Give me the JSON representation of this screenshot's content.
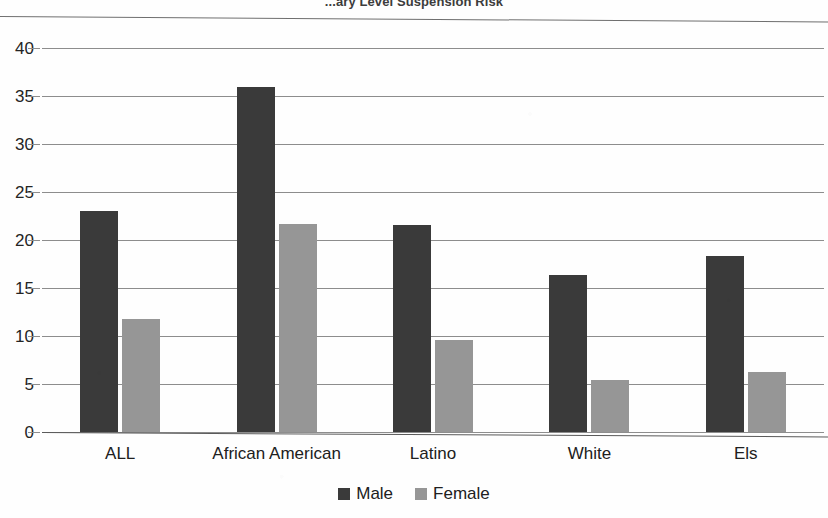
{
  "chart_data": {
    "type": "bar",
    "title": "...ary Level Suspension Risk",
    "xlabel": "",
    "ylabel": "",
    "ylim": [
      0,
      40
    ],
    "yticks": [
      0,
      5,
      10,
      15,
      20,
      25,
      30,
      35,
      40
    ],
    "grid": true,
    "legend_position": "bottom",
    "categories": [
      "ALL",
      "African American",
      "Latino",
      "White",
      "Els"
    ],
    "series": [
      {
        "name": "Male",
        "color": "#3a3a3a",
        "values": [
          23.0,
          35.9,
          21.6,
          16.4,
          18.3
        ]
      },
      {
        "name": "Female",
        "color": "#969696",
        "values": [
          11.8,
          21.7,
          9.6,
          5.4,
          6.2
        ]
      }
    ]
  },
  "axis": {
    "tick_labels": [
      "40",
      "35",
      "30",
      "25",
      "20",
      "15",
      "10",
      "5",
      "0"
    ]
  },
  "legend": {
    "items": [
      {
        "label": "Male"
      },
      {
        "label": "Female"
      }
    ]
  }
}
